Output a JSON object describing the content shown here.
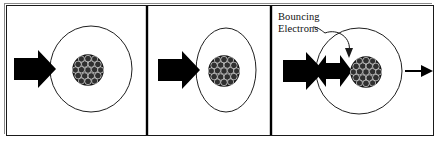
{
  "figure": {
    "background_color": "#ffffff",
    "ink_color": "#000000",
    "outline_color": "#1a1a1a",
    "width": 442,
    "height": 144
  },
  "annotations": {
    "bouncing_label_line1": "Bouncing",
    "bouncing_label_line2": "Electrons"
  },
  "panels": [
    {
      "name": "panel-large-circle",
      "atom_shape": "circle",
      "atom_cx": 91,
      "atom_cy": 69,
      "atom_rx": 41,
      "atom_ry": 43,
      "nucleus_cx": 88,
      "nucleus_cy": 70,
      "nucleus_r": 16,
      "incoming_arrow": "thick-block-arrow-right",
      "outgoing_arrow": "none",
      "bounce_arrows": "none"
    },
    {
      "name": "panel-narrow-ellipse",
      "atom_shape": "ellipse",
      "atom_cx": 226,
      "atom_cy": 70,
      "atom_rx": 30,
      "atom_ry": 42,
      "nucleus_cx": 224,
      "nucleus_cy": 71,
      "nucleus_r": 16,
      "incoming_arrow": "thick-block-arrow-right",
      "outgoing_arrow": "none",
      "bounce_arrows": "none"
    },
    {
      "name": "panel-bouncing-electrons",
      "atom_shape": "circle",
      "atom_cx": 359,
      "atom_cy": 71,
      "atom_rx": 43,
      "atom_ry": 43,
      "nucleus_cx": 366,
      "nucleus_cy": 72,
      "nucleus_r": 16,
      "incoming_arrow": "thick-block-arrow-right",
      "outgoing_arrow": "thin-line-arrow-right",
      "bounce_arrows": "double-headed-black-arrow"
    }
  ],
  "dividers": [
    {
      "name": "divider-1",
      "x": 147
    },
    {
      "name": "divider-2",
      "x": 271
    }
  ],
  "nucleus": {
    "description": "cluster of small dark particles",
    "particle_fill": "#2b2b2b",
    "particle_stroke": "#d8d8d8",
    "particle_radius": 3.3,
    "cluster_fill": "#111111"
  }
}
